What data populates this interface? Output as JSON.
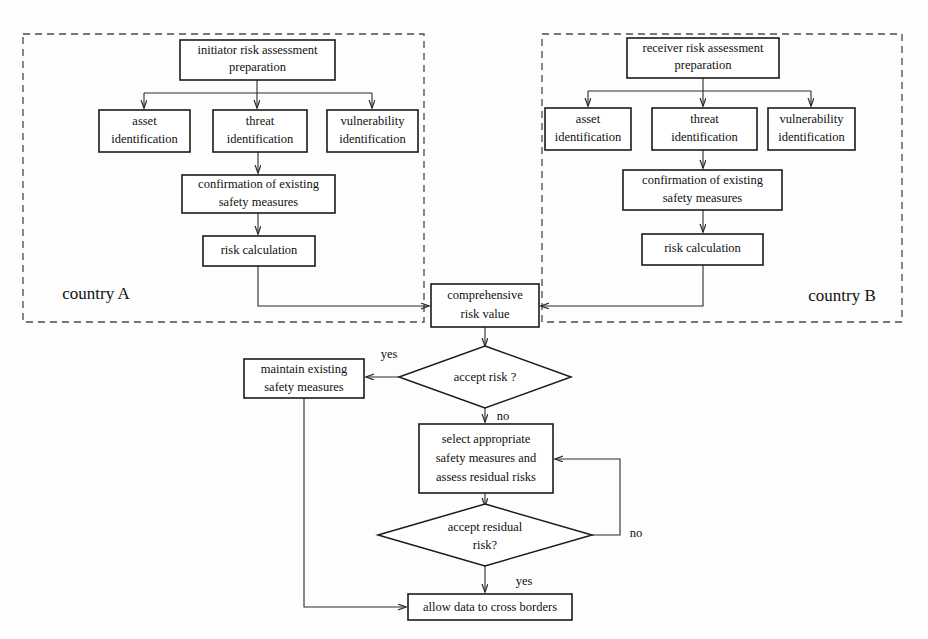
{
  "diagram": {
    "colors": {
      "background": "#fdfdfd",
      "node_stroke": "#1b1b1b",
      "node_fill": "#ffffff",
      "group_stroke": "#4a4a4a",
      "connector_stroke": "#2a2a2a",
      "text": "#101010"
    },
    "groups": [
      {
        "id": "country-a",
        "label": "country A",
        "label_x": 96,
        "label_y": 295,
        "x": 23,
        "y": 34,
        "w": 401,
        "h": 288
      },
      {
        "id": "country-b",
        "label": "country B",
        "label_x": 842,
        "label_y": 297,
        "x": 542,
        "y": 34,
        "w": 360,
        "h": 288
      }
    ],
    "nodes": [
      {
        "id": "initiator-prep",
        "shape": "rect",
        "lines": [
          "initiator risk assessment",
          "preparation"
        ],
        "x": 180,
        "y": 40,
        "w": 155,
        "h": 40
      },
      {
        "id": "a-asset-identification",
        "shape": "rect",
        "lines": [
          "asset",
          "identification"
        ],
        "x": 99,
        "y": 110,
        "w": 91,
        "h": 42
      },
      {
        "id": "a-threat-identification",
        "shape": "rect",
        "lines": [
          "threat",
          "identification"
        ],
        "x": 213,
        "y": 110,
        "w": 94,
        "h": 42
      },
      {
        "id": "a-vulnerability-identification",
        "shape": "rect",
        "lines": [
          "vulnerability",
          "identification"
        ],
        "x": 327,
        "y": 110,
        "w": 91,
        "h": 42
      },
      {
        "id": "a-confirmation",
        "shape": "rect",
        "lines": [
          "confirmation of existing",
          "safety measures"
        ],
        "x": 182,
        "y": 175,
        "w": 153,
        "h": 38
      },
      {
        "id": "a-risk-calculation",
        "shape": "rect",
        "lines": [
          "risk calculation"
        ],
        "x": 203,
        "y": 236,
        "w": 112,
        "h": 30
      },
      {
        "id": "receiver-prep",
        "shape": "rect",
        "lines": [
          "receiver risk assessment",
          "preparation"
        ],
        "x": 627,
        "y": 38,
        "w": 152,
        "h": 40
      },
      {
        "id": "b-asset-identification",
        "shape": "rect",
        "lines": [
          "asset",
          "identification"
        ],
        "x": 545,
        "y": 108,
        "w": 86,
        "h": 42
      },
      {
        "id": "b-threat-identification",
        "shape": "rect",
        "lines": [
          "threat",
          "identification"
        ],
        "x": 652,
        "y": 108,
        "w": 105,
        "h": 42
      },
      {
        "id": "b-vulnerability-identification",
        "shape": "rect",
        "lines": [
          "vulnerability",
          "identification"
        ],
        "x": 768,
        "y": 108,
        "w": 87,
        "h": 42
      },
      {
        "id": "b-confirmation",
        "shape": "rect",
        "lines": [
          "confirmation of existing",
          "safety measures"
        ],
        "x": 623,
        "y": 170,
        "w": 159,
        "h": 40
      },
      {
        "id": "b-risk-calculation",
        "shape": "rect",
        "lines": [
          "risk calculation"
        ],
        "x": 642,
        "y": 234,
        "w": 121,
        "h": 31
      },
      {
        "id": "comprehensive-risk-value",
        "shape": "rect",
        "lines": [
          "comprehensive",
          "risk value"
        ],
        "x": 431,
        "y": 284,
        "w": 108,
        "h": 43
      },
      {
        "id": "accept-risk",
        "shape": "diamond",
        "lines": [
          "accept risk ?"
        ],
        "cx": 485,
        "cy": 377,
        "rx": 86,
        "ry": 31
      },
      {
        "id": "maintain-existing-safety-measures",
        "shape": "rect",
        "lines": [
          "maintain existing",
          "safety measures"
        ],
        "x": 244,
        "y": 359,
        "w": 120,
        "h": 39
      },
      {
        "id": "select-appropriate-measures",
        "shape": "rect",
        "lines": [
          "select appropriate",
          "safety measures and",
          "assess residual risks"
        ],
        "x": 419,
        "y": 424,
        "w": 134,
        "h": 69
      },
      {
        "id": "accept-residual-risk",
        "shape": "diamond",
        "lines": [
          "accept residual",
          "risk?"
        ],
        "cx": 485,
        "cy": 535,
        "rx": 107,
        "ry": 31
      },
      {
        "id": "allow-data-to-cross-borders",
        "shape": "rect",
        "lines": [
          "allow data to cross borders"
        ],
        "x": 408,
        "y": 594,
        "w": 164,
        "h": 26
      }
    ],
    "edge_labels": [
      {
        "id": "accept-risk-yes",
        "text": "yes",
        "x": 389,
        "y": 355
      },
      {
        "id": "accept-risk-no",
        "text": "no",
        "x": 503,
        "y": 417
      },
      {
        "id": "residual-risk-no",
        "text": "no",
        "x": 636,
        "y": 534
      },
      {
        "id": "residual-risk-yes",
        "text": "yes",
        "x": 524,
        "y": 582
      }
    ]
  }
}
